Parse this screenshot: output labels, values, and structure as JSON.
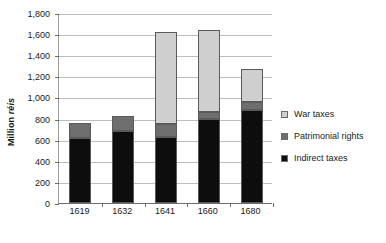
{
  "chart_data": {
    "type": "bar",
    "subtype": "stacked-column",
    "title": "",
    "xlabel": "",
    "ylabel": "Million réis",
    "ylabel_plain": "Million",
    "ylabel_italic": "réis",
    "categories": [
      "1619",
      "1632",
      "1641",
      "1660",
      "1680"
    ],
    "series": [
      {
        "name": "Indirect taxes",
        "color": "#0d0d0d",
        "values": [
          620,
          680,
          630,
          800,
          880
        ]
      },
      {
        "name": "Patrimonial rights",
        "color": "#6e6e6e",
        "values": [
          140,
          140,
          120,
          60,
          80
        ]
      },
      {
        "name": "War taxes",
        "color": "#cfcfcf",
        "values": [
          0,
          0,
          870,
          780,
          310
        ]
      }
    ],
    "totals": [
      760,
      820,
      1620,
      1640,
      1270
    ],
    "ylim": [
      0,
      1800
    ],
    "ytick_step": 200,
    "ytick_labels": [
      "0",
      "200",
      "400",
      "600",
      "800",
      "1,000",
      "1,200",
      "1,400",
      "1,600",
      "1,800"
    ],
    "grid": true,
    "grid_axis": "y",
    "legend_position": "right",
    "legend_order": [
      "War taxes",
      "Patrimonial rights",
      "Indirect taxes"
    ],
    "legend": [
      {
        "label": "War taxes",
        "color": "#cfcfcf"
      },
      {
        "label": "Patrimonial rights",
        "color": "#6e6e6e"
      },
      {
        "label": "Indirect taxes",
        "color": "#0d0d0d"
      }
    ]
  }
}
